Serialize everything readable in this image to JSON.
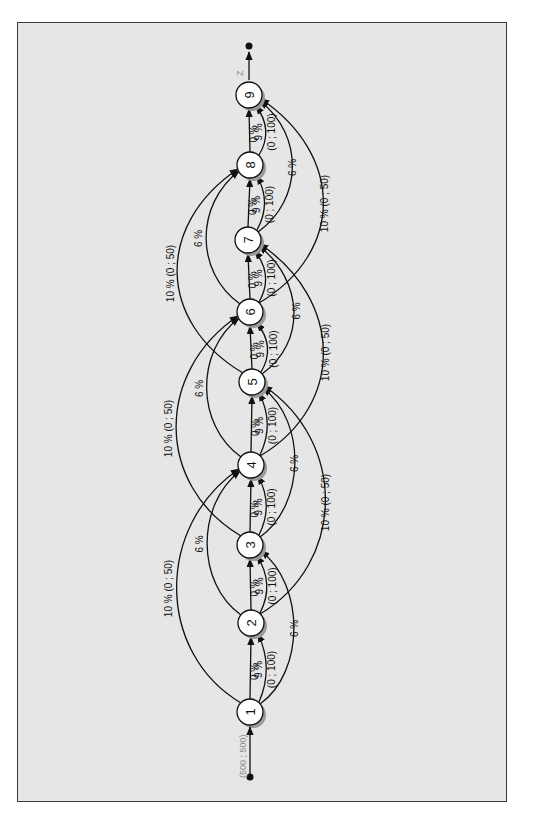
{
  "diagram": {
    "orientation": "rotated-90-ccw",
    "source": {
      "label": "(500 ; 500)"
    },
    "sink": {
      "label": "Z"
    },
    "nodes": [
      {
        "id": "1",
        "label": "1",
        "x": 250,
        "y": 712
      },
      {
        "id": "2",
        "label": "2",
        "x": 251,
        "y": 623
      },
      {
        "id": "3",
        "label": "3",
        "x": 250,
        "y": 545
      },
      {
        "id": "4",
        "label": "4",
        "x": 251,
        "y": 465
      },
      {
        "id": "5",
        "label": "5",
        "x": 252,
        "y": 382
      },
      {
        "id": "6",
        "label": "6",
        "x": 250,
        "y": 312
      },
      {
        "id": "7",
        "label": "7",
        "x": 248,
        "y": 240
      },
      {
        "id": "8",
        "label": "8",
        "x": 250,
        "y": 165
      },
      {
        "id": "9",
        "label": "9",
        "x": 249,
        "y": 95
      }
    ],
    "edge_labels": {
      "straight": "0 %",
      "short_curve_rate": "9 %",
      "short_curve_bounds": "(0 ; 100)",
      "skip2": "6 %",
      "skip3_rate": "10 %",
      "skip3_bounds": "(0 ; 50)"
    },
    "edges": [
      {
        "from": "1",
        "to": "2",
        "type": "straight",
        "label": "0 %"
      },
      {
        "from": "1",
        "to": "2",
        "type": "curve",
        "label": "9 %  (0 ; 100)"
      },
      {
        "from": "1",
        "to": "3",
        "type": "skip2",
        "label": "6 %"
      },
      {
        "from": "1",
        "to": "4",
        "type": "skip3",
        "label": "10 %  (0 ; 50)"
      },
      {
        "from": "2",
        "to": "3",
        "type": "straight",
        "label": "0 %"
      },
      {
        "from": "2",
        "to": "3",
        "type": "curve",
        "label": "9 %  (0 ; 100)"
      },
      {
        "from": "2",
        "to": "4",
        "type": "skip2",
        "label": "6 %"
      },
      {
        "from": "2",
        "to": "5",
        "type": "skip3",
        "label": "10 %  (0 ; 50)"
      },
      {
        "from": "3",
        "to": "4",
        "type": "straight",
        "label": "0 %"
      },
      {
        "from": "3",
        "to": "4",
        "type": "curve",
        "label": "9 %  (0 ; 100)"
      },
      {
        "from": "3",
        "to": "5",
        "type": "skip2",
        "label": "6 %"
      },
      {
        "from": "3",
        "to": "6",
        "type": "skip3",
        "label": "10 %  (0 ; 50)"
      },
      {
        "from": "4",
        "to": "5",
        "type": "straight",
        "label": "0 %"
      },
      {
        "from": "4",
        "to": "5",
        "type": "curve",
        "label": "9 %  (0 ; 100)"
      },
      {
        "from": "4",
        "to": "6",
        "type": "skip2",
        "label": "6 %"
      },
      {
        "from": "4",
        "to": "7",
        "type": "skip3",
        "label": "10 %  (0 ; 50)"
      },
      {
        "from": "5",
        "to": "6",
        "type": "straight",
        "label": "0 %"
      },
      {
        "from": "5",
        "to": "6",
        "type": "curve",
        "label": "9 %  (0 ; 100)"
      },
      {
        "from": "5",
        "to": "7",
        "type": "skip2",
        "label": "6 %"
      },
      {
        "from": "5",
        "to": "8",
        "type": "skip3",
        "label": "10 %  (0 ; 50)"
      },
      {
        "from": "6",
        "to": "7",
        "type": "straight",
        "label": "0 %"
      },
      {
        "from": "6",
        "to": "7",
        "type": "curve",
        "label": "9 %  (0 ; 100)"
      },
      {
        "from": "6",
        "to": "8",
        "type": "skip2",
        "label": "6 %"
      },
      {
        "from": "6",
        "to": "9",
        "type": "skip3",
        "label": "10 %  (0 ; 50)"
      },
      {
        "from": "7",
        "to": "8",
        "type": "straight",
        "label": "0 %"
      },
      {
        "from": "7",
        "to": "8",
        "type": "curve",
        "label": "9 %  (0 ; 100)"
      },
      {
        "from": "7",
        "to": "9",
        "type": "skip2",
        "label": "6 %"
      },
      {
        "from": "8",
        "to": "9",
        "type": "straight",
        "label": "0 %"
      },
      {
        "from": "8",
        "to": "9",
        "type": "curve",
        "label": "9 %  (0 ; 100)"
      }
    ],
    "colors": {
      "background": "#e6e6e6",
      "frame": "#3a3a3a",
      "ink": "#111111",
      "muted_label": "#8a8a8a"
    }
  }
}
